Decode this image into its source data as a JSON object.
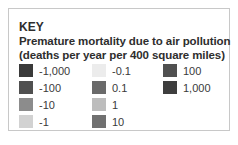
{
  "key": {
    "title": "KEY",
    "heading_line1": "Premature mortality due to air pollution",
    "heading_line2": "(deaths per year per 400 square miles)",
    "items": [
      {
        "label": "-1,000",
        "color": "#3a3a3a"
      },
      {
        "label": "-100",
        "color": "#505050"
      },
      {
        "label": "-10",
        "color": "#8c8c8c"
      },
      {
        "label": "-1",
        "color": "#d2d2d2"
      },
      {
        "label": "-0.1",
        "color": "#ececec"
      },
      {
        "label": "0.1",
        "color": "#6a6a6a"
      },
      {
        "label": "1",
        "color": "#bdbdbd"
      },
      {
        "label": "10",
        "color": "#707070"
      },
      {
        "label": "100",
        "color": "#505050"
      },
      {
        "label": "1,000",
        "color": "#3e3e3e"
      }
    ]
  }
}
